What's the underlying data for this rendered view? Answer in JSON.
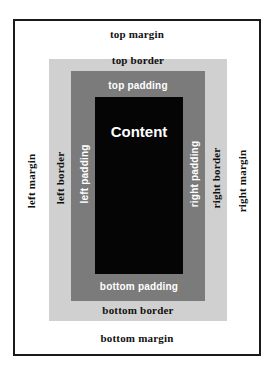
{
  "diagram": {
    "title": "",
    "colors": {
      "margin": "#ffffff",
      "border": "#d0d0d0",
      "padding": "#7b7b7b",
      "content": "#050505",
      "frame": "#1a1a1a"
    },
    "content": {
      "label": "Content"
    },
    "margin": {
      "top": "top margin",
      "bottom": "bottom margin",
      "left": "left margin",
      "right": "right margin"
    },
    "border": {
      "top": "top border",
      "bottom": "bottom border",
      "left": "left border",
      "right": "right border"
    },
    "padding": {
      "top": "top padding",
      "bottom": "bottom padding",
      "left": "left padding",
      "right": "right padding"
    }
  }
}
